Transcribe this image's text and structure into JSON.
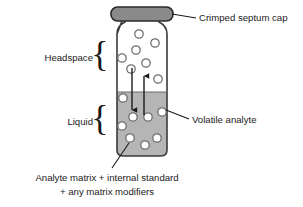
{
  "diagram": {
    "colors": {
      "cap_fill": "#8a8a8a",
      "cap_stroke": "#2b2b2b",
      "vial_stroke": "#3a3a3a",
      "liquid_fill": "#b5b5b5",
      "headspace_fill": "#ffffff",
      "bubble_fill": "#ffffff",
      "bubble_stroke": "#6e6e6e",
      "arrow_color": "#1a1a1a",
      "leader_color": "#1a1a1a",
      "text_color": "#1a1a1a",
      "background": "#ffffff"
    },
    "labels": {
      "cap": "Crimped septum cap",
      "headspace": "Headspace",
      "liquid": "Liquid",
      "analyte": "Volatile analyte",
      "caption_line1": "Analyte matrix + internal standard",
      "caption_line2": "+ any matrix modifiers"
    },
    "braces": {
      "headspace_glyph": "{",
      "liquid_glyph": "{"
    },
    "regions": {
      "headspace_top": 30,
      "liquid_level": 92,
      "vial_bottom": 156
    },
    "bubbles_headspace": [
      {
        "cx": 139,
        "cy": 34,
        "r": 4.2
      },
      {
        "cx": 155,
        "cy": 43,
        "r": 4.2
      },
      {
        "cx": 136,
        "cy": 50,
        "r": 4.2
      },
      {
        "cx": 122,
        "cy": 58,
        "r": 4.2
      },
      {
        "cx": 146,
        "cy": 63,
        "r": 4.2
      },
      {
        "cx": 131,
        "cy": 69,
        "r": 4.2
      },
      {
        "cx": 158,
        "cy": 79,
        "r": 4.2
      }
    ],
    "bubbles_liquid": [
      {
        "cx": 123,
        "cy": 98,
        "r": 4.2
      },
      {
        "cx": 133,
        "cy": 117,
        "r": 4.2
      },
      {
        "cx": 148,
        "cy": 117,
        "r": 4.2
      },
      {
        "cx": 162,
        "cy": 112,
        "r": 4.2
      },
      {
        "cx": 122,
        "cy": 126,
        "r": 4.2
      },
      {
        "cx": 130,
        "cy": 138,
        "r": 4.2
      },
      {
        "cx": 145,
        "cy": 145,
        "r": 4.2
      },
      {
        "cx": 157,
        "cy": 138,
        "r": 4.2
      }
    ],
    "arrows": [
      {
        "name": "downward-arrow",
        "x": 132,
        "y1": 68,
        "y2": 112,
        "direction": "down"
      },
      {
        "name": "upward-arrow",
        "x": 144,
        "y1": 115,
        "y2": 74,
        "direction": "up"
      }
    ]
  }
}
